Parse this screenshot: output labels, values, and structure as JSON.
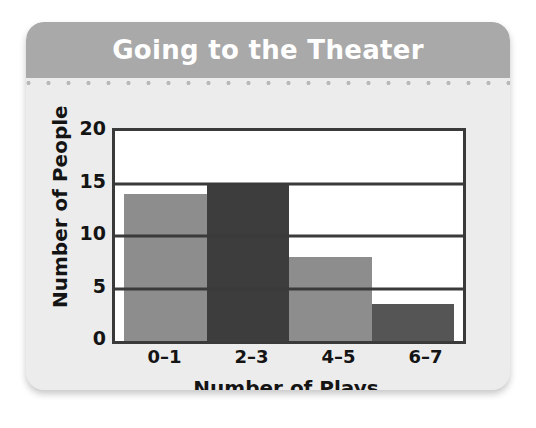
{
  "card": {
    "header_background": "#a9a9a9",
    "body_background": "#ececec"
  },
  "chart_data": {
    "type": "bar",
    "title": "Going to the Theater",
    "xlabel": "Number of Plays",
    "ylabel": "Number of People",
    "categories": [
      "0–1",
      "2–3",
      "4–5",
      "6–7"
    ],
    "values": [
      14,
      15,
      8,
      3.5
    ],
    "bar_colors": [
      "#8d8d8d",
      "#3d3d3d",
      "#8d8d8d",
      "#555555"
    ],
    "ylim": [
      0,
      20
    ],
    "yticks": [
      0,
      5,
      10,
      15,
      20
    ],
    "ytick_labels": [
      "0",
      "5",
      "10",
      "15",
      "20"
    ],
    "grid": true,
    "legend": "none"
  }
}
